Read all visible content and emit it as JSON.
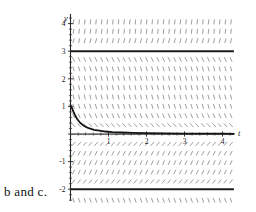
{
  "caption": {
    "text": "b and c."
  },
  "chart_data": {
    "type": "line",
    "title": "",
    "subtitle": "",
    "xlabel": "t",
    "ylabel": "y",
    "grid": false,
    "legend_position": "none",
    "xlim": [
      -0.1,
      4.35
    ],
    "ylim": [
      -2.45,
      4.45
    ],
    "xticks": [
      1,
      2,
      3,
      4
    ],
    "yticks": [
      4,
      3,
      2,
      1,
      -1,
      -2
    ],
    "xtick_labels": [
      "1",
      "2",
      "3",
      "4"
    ],
    "ytick_labels": [
      "4",
      "3",
      "2",
      "1",
      "-1",
      "-2"
    ],
    "minor_tick_step": 0.2,
    "slope_field": {
      "type": "direction-field",
      "dash_color": "#7d7d7d",
      "t_start": 0.08,
      "t_end": 4.3,
      "t_step": 0.148,
      "y_start": -2.4,
      "y_end": 4.4,
      "y_step": 0.34,
      "equation": "dy/dt = k*(y-3)*(y+2)*y",
      "regions": [
        {
          "range": [
            3,
            4.45
          ],
          "slope_sign": "positive",
          "steepness": "steep"
        },
        {
          "range": [
            0,
            3
          ],
          "slope_sign": "negative",
          "steepness": "steep"
        },
        {
          "range": [
            -2,
            0
          ],
          "slope_sign": "positive",
          "steepness": "moderate"
        },
        {
          "range": [
            -2.45,
            -2
          ],
          "slope_sign": "negative",
          "steepness": "steep"
        }
      ]
    },
    "equilibrium_lines": [
      {
        "label": "y = 3",
        "value": 3,
        "t_from": 0,
        "t_to": 4.3
      },
      {
        "label": "y = -2",
        "value": -2,
        "t_from": 0,
        "t_to": 4.3
      }
    ],
    "series": [
      {
        "name": "solution-curve",
        "color": "#151515",
        "x": [
          0.0,
          0.04,
          0.08,
          0.12,
          0.16,
          0.2,
          0.26,
          0.32,
          0.4,
          0.5,
          0.62,
          0.76,
          0.92,
          1.1,
          1.35,
          1.65,
          2.0,
          2.5,
          3.0,
          3.5,
          4.0,
          4.3
        ],
        "y": [
          1.05,
          0.93,
          0.8,
          0.68,
          0.58,
          0.5,
          0.4,
          0.33,
          0.26,
          0.2,
          0.15,
          0.12,
          0.09,
          0.07,
          0.055,
          0.04,
          0.03,
          0.02,
          0.015,
          0.012,
          0.01,
          0.008
        ]
      }
    ]
  },
  "colors": {
    "background": "#ffffff",
    "axis": "#262626",
    "curve": "#151515",
    "slope_dash": "#7d7d7d",
    "text": "#1a1a1a"
  }
}
